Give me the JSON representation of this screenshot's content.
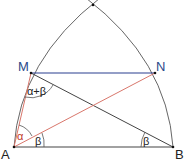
{
  "diagram": {
    "points": {
      "A": {
        "label": "A",
        "x": 14,
        "y": 147
      },
      "B": {
        "label": "B",
        "x": 173,
        "y": 147
      },
      "M": {
        "label": "M",
        "x": 31,
        "y": 73
      },
      "N": {
        "label": "N",
        "x": 155,
        "y": 73
      },
      "apex": {
        "x": 93,
        "y": 5
      }
    },
    "angles": {
      "alpha_label": "α",
      "beta_at_A_label": "β",
      "beta_at_B_label": "β",
      "alpha_plus_beta_label": "α+β"
    },
    "colors": {
      "line": "#333333",
      "arc": "#555555",
      "mn_segment": "#2a3f8f",
      "red_segment": "#d9776c",
      "alpha_label": "#c0392b",
      "point_label_blue": "#2b4a8a",
      "point_label_dark": "#222222"
    }
  }
}
